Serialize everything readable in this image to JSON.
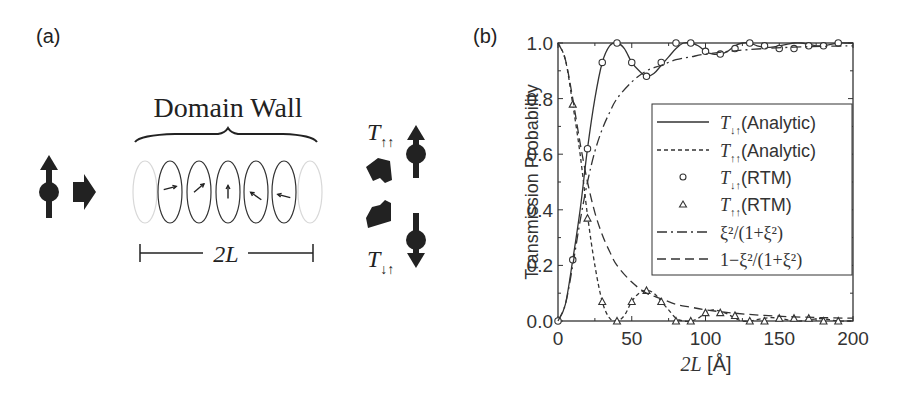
{
  "panel_a": {
    "label": "(a)",
    "domain_wall_label": "Domain Wall",
    "width_label": "2L",
    "t_upup_label": "T",
    "t_upup_sub": "↑↑",
    "t_downup_label": "T",
    "t_downup_sub": "↓↑",
    "spin_arrow_angles_deg": [
      -15,
      -40,
      -90,
      -145,
      -165
    ]
  },
  "panel_b": {
    "label": "(b)"
  },
  "chart_data": {
    "type": "line",
    "title": "",
    "xlabel": "2L [Å]",
    "ylabel": "Transmission Probability",
    "xlim": [
      0,
      200
    ],
    "ylim": [
      0,
      1.0
    ],
    "xticks": [
      0,
      50,
      100,
      150,
      200
    ],
    "xtick_labels": [
      "0",
      "50",
      "100",
      "150",
      "200"
    ],
    "yticks": [
      0.0,
      0.2,
      0.4,
      0.6,
      0.8,
      1.0
    ],
    "ytick_labels": [
      "0.0",
      "0.2",
      "0.4",
      "0.6",
      "0.8",
      "1.0"
    ],
    "grid": false,
    "legend_position": "center-right",
    "series": [
      {
        "name": "T↓↑ (Analytic)",
        "legend_main": "T",
        "legend_sub": "↓↑",
        "legend_suffix": "(Analytic)",
        "style": "solid",
        "x": [
          0,
          5,
          10,
          15,
          20,
          25,
          30,
          35,
          40,
          45,
          50,
          55,
          60,
          65,
          70,
          75,
          80,
          85,
          90,
          95,
          100,
          105,
          110,
          115,
          120,
          125,
          130,
          135,
          140,
          145,
          150,
          155,
          160,
          165,
          170,
          175,
          180,
          185,
          190,
          195,
          200
        ],
        "y": [
          0.0,
          0.06,
          0.22,
          0.4,
          0.62,
          0.8,
          0.93,
          0.99,
          1.0,
          0.98,
          0.93,
          0.9,
          0.88,
          0.89,
          0.92,
          0.95,
          0.98,
          1.0,
          1.0,
          0.99,
          0.97,
          0.96,
          0.96,
          0.97,
          0.99,
          1.0,
          1.0,
          0.99,
          0.985,
          0.985,
          0.99,
          0.995,
          1.0,
          1.0,
          0.995,
          0.99,
          0.99,
          0.995,
          1.0,
          1.0,
          1.0
        ]
      },
      {
        "name": "T↑↑ (Analytic)",
        "legend_main": "T",
        "legend_sub": "↑↑",
        "legend_suffix": "(Analytic)",
        "style": "dashed-short",
        "x": [
          0,
          5,
          10,
          15,
          20,
          25,
          30,
          35,
          40,
          45,
          50,
          55,
          60,
          65,
          70,
          75,
          80,
          85,
          90,
          95,
          100,
          105,
          110,
          115,
          120,
          125,
          130,
          135,
          140,
          145,
          150,
          155,
          160,
          165,
          170,
          175,
          180,
          185,
          190,
          195,
          200
        ],
        "y": [
          1.0,
          0.94,
          0.78,
          0.6,
          0.38,
          0.2,
          0.07,
          0.01,
          0.0,
          0.02,
          0.07,
          0.1,
          0.11,
          0.1,
          0.07,
          0.04,
          0.01,
          0.0,
          0.0,
          0.01,
          0.03,
          0.04,
          0.035,
          0.025,
          0.01,
          0.0,
          0.0,
          0.005,
          0.01,
          0.012,
          0.01,
          0.005,
          0.0,
          0.0,
          0.004,
          0.008,
          0.008,
          0.004,
          0.0,
          0.0,
          0.0
        ]
      },
      {
        "name": "T↓↑ (RTM)",
        "legend_main": "T",
        "legend_sub": "↓↑",
        "legend_suffix": "(RTM)",
        "style": "marker-circle",
        "x": [
          0,
          10,
          20,
          30,
          40,
          50,
          60,
          70,
          80,
          90,
          100,
          110,
          120,
          130,
          140,
          150,
          160,
          170,
          180,
          190
        ],
        "y": [
          0.0,
          0.22,
          0.62,
          0.93,
          1.0,
          0.93,
          0.88,
          0.93,
          1.0,
          1.0,
          0.97,
          0.96,
          0.98,
          1.0,
          0.99,
          0.98,
          0.98,
          0.99,
          0.99,
          1.0
        ]
      },
      {
        "name": "T↑↑ (RTM)",
        "legend_main": "T",
        "legend_sub": "↑↑",
        "legend_suffix": "(RTM)",
        "style": "marker-triangle",
        "x": [
          10,
          20,
          30,
          40,
          50,
          60,
          70,
          80,
          90,
          100,
          110,
          120,
          130,
          140,
          150,
          160,
          170,
          180,
          190
        ],
        "y": [
          0.78,
          0.37,
          0.07,
          0.0,
          0.07,
          0.11,
          0.07,
          0.0,
          0.0,
          0.03,
          0.03,
          0.02,
          0.0,
          0.0,
          0.01,
          0.01,
          0.01,
          0.0,
          0.0
        ]
      },
      {
        "name": "ξ²/(1+ξ²)",
        "legend_text": "ξ²/(1+ξ²)",
        "style": "dash-dot",
        "x": [
          0,
          5,
          10,
          15,
          20,
          25,
          30,
          35,
          40,
          50,
          60,
          70,
          80,
          90,
          100,
          120,
          140,
          160,
          180,
          200
        ],
        "y": [
          0.0,
          0.06,
          0.2,
          0.36,
          0.5,
          0.61,
          0.69,
          0.75,
          0.8,
          0.86,
          0.9,
          0.92,
          0.94,
          0.95,
          0.96,
          0.972,
          0.98,
          0.985,
          0.988,
          0.99
        ]
      },
      {
        "name": "1−ξ²/(1+ξ²)",
        "legend_text": "1−ξ²/(1+ξ²)",
        "style": "dashed-long",
        "x": [
          0,
          5,
          10,
          15,
          20,
          25,
          30,
          35,
          40,
          50,
          60,
          70,
          80,
          90,
          100,
          120,
          140,
          160,
          180,
          200
        ],
        "y": [
          1.0,
          0.94,
          0.8,
          0.64,
          0.5,
          0.39,
          0.31,
          0.25,
          0.2,
          0.14,
          0.1,
          0.08,
          0.06,
          0.05,
          0.04,
          0.028,
          0.02,
          0.015,
          0.012,
          0.01
        ]
      }
    ]
  }
}
